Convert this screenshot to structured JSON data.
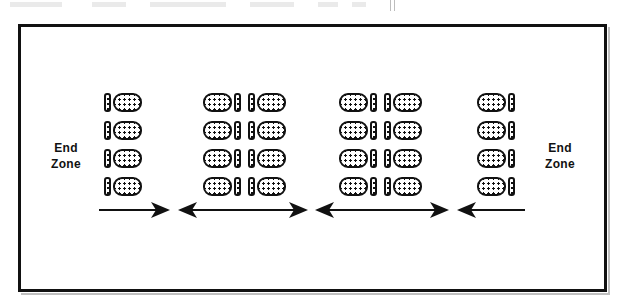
{
  "page": {
    "background_color": "#ffffff",
    "ink_color": "#111111"
  },
  "frame": {
    "name": "diagram-border",
    "stroke_color": "#111111",
    "stroke_width_px": 3
  },
  "labels": {
    "end_zone_left": "End\nZone",
    "end_zone_left_line1": "End",
    "end_zone_left_line2": "Zone",
    "end_zone_right_line1": "End",
    "end_zone_right_line2": "Zone"
  },
  "legend": {
    "player_symbol": "stippled-oval",
    "marker_symbol": "stippled-vertical-bar"
  },
  "formation": {
    "rows_per_group": 4,
    "groups": [
      {
        "id": "group-1",
        "name": "group-1-left",
        "pattern": [
          "bar",
          "player"
        ],
        "players_per_row": 1,
        "bars_per_row": 1,
        "total_players": 4,
        "total_bars": 4
      },
      {
        "id": "group-2",
        "name": "group-2",
        "pattern": [
          "player",
          "bar",
          "gap",
          "bar",
          "player"
        ],
        "players_per_row": 2,
        "bars_per_row": 2,
        "total_players": 8,
        "total_bars": 8
      },
      {
        "id": "group-3",
        "name": "group-3",
        "pattern": [
          "player",
          "bar",
          "gap",
          "bar",
          "player"
        ],
        "players_per_row": 2,
        "bars_per_row": 2,
        "total_players": 8,
        "total_bars": 8
      },
      {
        "id": "group-4",
        "name": "group-4-right",
        "pattern": [
          "player",
          "bar"
        ],
        "players_per_row": 1,
        "bars_per_row": 1,
        "total_players": 4,
        "total_bars": 4
      }
    ]
  },
  "arrows": [
    {
      "id": "arrow-1",
      "name": "arrow-right-1",
      "direction": "right",
      "heads": 1,
      "left_px": 99,
      "width_px": 72
    },
    {
      "id": "arrow-2",
      "name": "arrow-double-2",
      "direction": "both",
      "heads": 2,
      "left_px": 178,
      "width_px": 130
    },
    {
      "id": "arrow-3",
      "name": "arrow-double-3",
      "direction": "both",
      "heads": 2,
      "left_px": 315,
      "width_px": 134
    },
    {
      "id": "arrow-4",
      "name": "arrow-left-4",
      "direction": "left",
      "heads": 1,
      "left_px": 457,
      "width_px": 68
    }
  ]
}
